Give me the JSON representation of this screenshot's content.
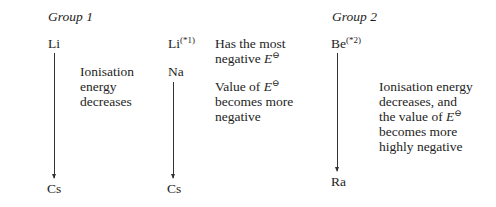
{
  "group1": {
    "heading": "Group 1",
    "col1": {
      "top": "Li",
      "bottom": "Cs",
      "description": [
        "Ionisation",
        "energy",
        "decreases"
      ]
    },
    "col2": {
      "top": "Li",
      "top_note": "(*1)",
      "second": "Na",
      "bottom": "Cs",
      "note_top": {
        "line1": "Has the most",
        "line2_prefix": "negative ",
        "symbol": "E",
        "symbol_sup": "⊖"
      },
      "note_value": {
        "line1_prefix": "Value of ",
        "symbol": "E",
        "symbol_sup": "⊖",
        "line2": "becomes more",
        "line3": "negative"
      }
    }
  },
  "group2": {
    "heading": "Group 2",
    "top": "Be",
    "top_note": "(*2)",
    "bottom": "Ra",
    "description": {
      "line1": "Ionisation energy",
      "line2": "decreases, and",
      "line3_prefix": "the value of ",
      "symbol": "E",
      "symbol_sup": "⊖",
      "line4": "becomes more",
      "line5": "highly negative"
    }
  }
}
